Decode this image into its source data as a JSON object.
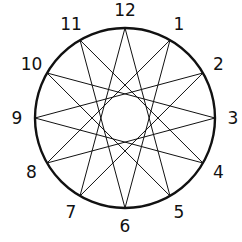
{
  "diagram": {
    "type": "star-polygon",
    "points": [
      "12",
      "1",
      "2",
      "3",
      "4",
      "5",
      "6",
      "7",
      "8",
      "9",
      "10",
      "11"
    ],
    "step": 5,
    "circle": {
      "cx": 125,
      "cy": 118,
      "r": 90
    },
    "label_radius": 108,
    "stroke_color": "#111111"
  }
}
